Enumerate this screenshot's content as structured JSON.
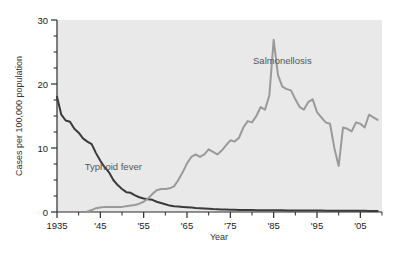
{
  "chart_data": {
    "type": "line",
    "title": "",
    "subtitle": "",
    "xlabel": "Year",
    "ylabel": "Cases per 100,000 population",
    "xlim": [
      1935,
      2010
    ],
    "ylim": [
      0,
      30
    ],
    "grid": false,
    "legend_position": "inline-annotations",
    "x_tick_labels": [
      "1935",
      "'45",
      "'55",
      "'65",
      "'75",
      "'85",
      "'95",
      "'05"
    ],
    "x_tick_values": [
      1935,
      1945,
      1955,
      1965,
      1975,
      1985,
      1995,
      2005
    ],
    "x_minor_tick_interval": 5,
    "y_tick_labels": [
      "0",
      "10",
      "20",
      "30"
    ],
    "y_tick_values": [
      0,
      10,
      20,
      30
    ],
    "y_minor_tick_interval": 2.5,
    "plot_background_color": "#e9e9e9",
    "page_background_color": "#ffffff",
    "annotations": [
      {
        "text": "Typhoid fever",
        "x": 1948,
        "y": 6.5,
        "color": "#5a5a5a"
      },
      {
        "text": "Salmonellosis",
        "x": 1987,
        "y": 23.2,
        "color": "#5a5a5a"
      }
    ],
    "series": [
      {
        "name": "Typhoid fever",
        "color": "#3a3a3a",
        "line_width": 2.0,
        "x": [
          1935,
          1936,
          1937,
          1938,
          1939,
          1940,
          1941,
          1942,
          1943,
          1944,
          1945,
          1946,
          1947,
          1948,
          1949,
          1950,
          1951,
          1952,
          1953,
          1954,
          1955,
          1956,
          1957,
          1958,
          1959,
          1960,
          1961,
          1962,
          1963,
          1964,
          1965,
          1966,
          1967,
          1968,
          1969,
          1970,
          1971,
          1972,
          1973,
          1974,
          1975,
          1976,
          1977,
          1978,
          1979,
          1980,
          1981,
          1982,
          1983,
          1984,
          1985,
          1986,
          1987,
          1988,
          1989,
          1990,
          1991,
          1992,
          1993,
          1994,
          1995,
          1996,
          1997,
          1998,
          1999,
          2000,
          2001,
          2002,
          2003,
          2004,
          2005,
          2006,
          2007,
          2008,
          2009
        ],
        "values": [
          18.0,
          15.2,
          14.3,
          14.1,
          13.0,
          12.4,
          11.5,
          11.0,
          10.6,
          9.2,
          8.0,
          7.0,
          6.2,
          5.0,
          4.2,
          3.6,
          3.1,
          3.0,
          2.6,
          2.3,
          2.1,
          2.0,
          1.9,
          1.6,
          1.4,
          1.2,
          1.0,
          0.9,
          0.85,
          0.8,
          0.75,
          0.7,
          0.62,
          0.58,
          0.55,
          0.5,
          0.45,
          0.42,
          0.4,
          0.38,
          0.36,
          0.34,
          0.33,
          0.32,
          0.31,
          0.3,
          0.29,
          0.28,
          0.28,
          0.27,
          0.27,
          0.26,
          0.26,
          0.25,
          0.25,
          0.24,
          0.24,
          0.23,
          0.23,
          0.22,
          0.22,
          0.22,
          0.21,
          0.21,
          0.2,
          0.2,
          0.2,
          0.19,
          0.19,
          0.18,
          0.18,
          0.18,
          0.17,
          0.17,
          0.17
        ]
      },
      {
        "name": "Salmonellosis",
        "color": "#9a9a9a",
        "line_width": 2.0,
        "x": [
          1942,
          1943,
          1944,
          1945,
          1946,
          1947,
          1948,
          1949,
          1950,
          1951,
          1952,
          1953,
          1954,
          1955,
          1956,
          1957,
          1958,
          1959,
          1960,
          1961,
          1962,
          1963,
          1964,
          1965,
          1966,
          1967,
          1968,
          1969,
          1970,
          1971,
          1972,
          1973,
          1974,
          1975,
          1976,
          1977,
          1978,
          1979,
          1980,
          1981,
          1982,
          1983,
          1984,
          1985,
          1986,
          1987,
          1988,
          1989,
          1990,
          1991,
          1992,
          1993,
          1994,
          1995,
          1996,
          1997,
          1998,
          1999,
          2000,
          2001,
          2002,
          2003,
          2004,
          2005,
          2006,
          2007,
          2008,
          2009
        ],
        "values": [
          0.1,
          0.3,
          0.6,
          0.7,
          0.8,
          0.8,
          0.8,
          0.8,
          0.8,
          0.9,
          1.0,
          1.1,
          1.3,
          1.6,
          2.1,
          2.8,
          3.4,
          3.6,
          3.6,
          3.7,
          4.0,
          5.0,
          6.2,
          7.6,
          8.6,
          9.0,
          8.6,
          9.0,
          9.8,
          9.4,
          9.0,
          9.6,
          10.4,
          11.2,
          11.0,
          11.6,
          13.2,
          14.2,
          14.0,
          15.0,
          16.4,
          16.0,
          18.2,
          26.9,
          21.4,
          19.6,
          19.2,
          19.0,
          17.6,
          16.4,
          16.0,
          17.2,
          17.6,
          15.6,
          14.8,
          14.0,
          13.8,
          10.0,
          7.2,
          13.2,
          13.0,
          12.6,
          14.0,
          13.8,
          13.2,
          15.2,
          14.8,
          14.4
        ]
      }
    ]
  }
}
